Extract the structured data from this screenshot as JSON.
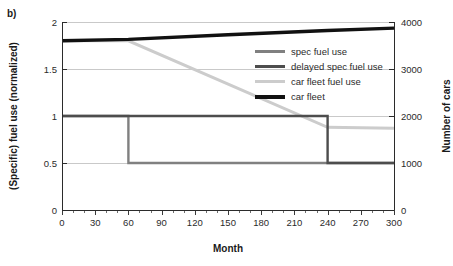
{
  "panel": {
    "label": "b)"
  },
  "axes": {
    "x": {
      "title": "Month",
      "ticks": [
        0,
        30,
        60,
        90,
        120,
        150,
        180,
        210,
        240,
        270,
        300
      ],
      "min": 0,
      "max": 300
    },
    "y_left": {
      "title": "(Specific) fuel use (normalized)",
      "ticks": [
        "0",
        "0.5",
        "1",
        "1.5",
        "2"
      ],
      "min": 0,
      "max": 2
    },
    "y_right": {
      "title": "Number of cars",
      "ticks": [
        "0",
        "1000",
        "2000",
        "3000",
        "4000"
      ],
      "min": 0,
      "max": 4000
    }
  },
  "legend": {
    "position": "inside-top-right",
    "items": [
      {
        "label": "spec fuel use",
        "color": "#808080"
      },
      {
        "label": "delayed spec fuel use",
        "color": "#4d4d4d"
      },
      {
        "label": "car fleet fuel use",
        "color": "#cccccc"
      },
      {
        "label": "car fleet",
        "color": "#111111"
      }
    ]
  },
  "chart_data": {
    "type": "line",
    "title": "",
    "xlabel": "Month",
    "ylabel": "(Specific) fuel use (normalized)",
    "y2label": "Number of cars",
    "xlim": [
      0,
      300
    ],
    "ylim": [
      0,
      2
    ],
    "y2lim": [
      0,
      4000
    ],
    "xticks": [
      0,
      30,
      60,
      90,
      120,
      150,
      180,
      210,
      240,
      270,
      300
    ],
    "yticks": [
      0,
      0.5,
      1,
      1.5,
      2
    ],
    "y2ticks": [
      0,
      1000,
      2000,
      3000,
      4000
    ],
    "grid": true,
    "grid_axis": "y",
    "legend_position": "inside-top-right",
    "series": [
      {
        "name": "spec fuel use",
        "axis": "left",
        "color": "#808080",
        "width": 2.4,
        "shape": "step",
        "points": [
          {
            "x": 0,
            "y": 1.0
          },
          {
            "x": 60,
            "y": 1.0
          },
          {
            "x": 60,
            "y": 0.5
          },
          {
            "x": 300,
            "y": 0.5
          }
        ]
      },
      {
        "name": "delayed spec fuel use",
        "axis": "left",
        "color": "#4d4d4d",
        "width": 2.4,
        "shape": "step",
        "points": [
          {
            "x": 0,
            "y": 1.0
          },
          {
            "x": 240,
            "y": 1.0
          },
          {
            "x": 240,
            "y": 0.5
          },
          {
            "x": 300,
            "y": 0.5
          }
        ]
      },
      {
        "name": "car fleet fuel use",
        "axis": "left",
        "color": "#cccccc",
        "width": 3.0,
        "shape": "line",
        "points": [
          {
            "x": 0,
            "y": 1.8
          },
          {
            "x": 60,
            "y": 1.8
          },
          {
            "x": 240,
            "y": 0.88
          },
          {
            "x": 300,
            "y": 0.87
          }
        ]
      },
      {
        "name": "car fleet",
        "axis": "right",
        "color": "#111111",
        "width": 3.4,
        "shape": "line",
        "points": [
          {
            "x": 0,
            "y": 3600
          },
          {
            "x": 60,
            "y": 3630
          },
          {
            "x": 150,
            "y": 3730
          },
          {
            "x": 240,
            "y": 3820
          },
          {
            "x": 300,
            "y": 3870
          }
        ]
      }
    ]
  }
}
